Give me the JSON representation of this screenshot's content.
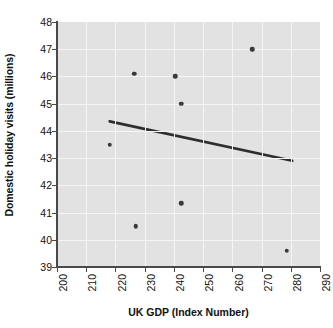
{
  "chart_data": {
    "type": "scatter",
    "title": "",
    "xlabel": "UK GDP (Index Number)",
    "ylabel": "Domestic holiday visits (millions)",
    "xlim": [
      200,
      290
    ],
    "ylim": [
      39,
      48
    ],
    "xticks": [
      200,
      210,
      220,
      230,
      240,
      250,
      260,
      270,
      280,
      290
    ],
    "yticks": [
      39,
      40,
      41,
      42,
      43,
      44,
      45,
      46,
      47,
      48
    ],
    "grid": true,
    "legend": null,
    "points": [
      {
        "x": 218.0,
        "y": 43.5
      },
      {
        "x": 226.5,
        "y": 46.1
      },
      {
        "x": 227.0,
        "y": 40.5
      },
      {
        "x": 240.5,
        "y": 46.0
      },
      {
        "x": 242.5,
        "y": 45.0
      },
      {
        "x": 242.5,
        "y": 41.35
      },
      {
        "x": 266.8,
        "y": 47.0
      },
      {
        "x": 278.7,
        "y": 39.6
      }
    ],
    "trendline": {
      "x0": 218.0,
      "y0": 44.35,
      "x1": 280.5,
      "y1": 42.9,
      "color": "#2e2e2e"
    },
    "colors": {
      "plot_background": "#e2e2e2",
      "grid": "#f5f5f5",
      "marker": "#3a3a3a",
      "axis": "#4a4a4a",
      "text": "#111111"
    }
  }
}
